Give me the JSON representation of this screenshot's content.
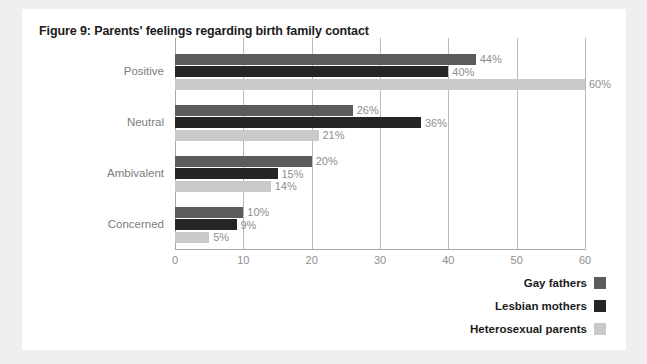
{
  "figure": {
    "title": "Figure 9: Parents' feelings regarding birth family contact"
  },
  "colors": {
    "gay_fathers": "#5b5b5b",
    "lesbian_mothers": "#252525",
    "heterosexual_parents": "#c9c9c9",
    "page_background": "#f0efee",
    "card_background": "#ffffff",
    "grid": "#b9b9b9",
    "tick_text": "#8e8e8e",
    "category_text": "#7d7d7d",
    "title_text": "#1b1b1b"
  },
  "legend": {
    "items": [
      {
        "label": "Gay fathers",
        "color": "#5b5b5b"
      },
      {
        "label": "Lesbian mothers",
        "color": "#252525"
      },
      {
        "label": "Heterosexual parents",
        "color": "#c9c9c9"
      }
    ]
  },
  "axis": {
    "ticks": [
      "0",
      "10",
      "20",
      "30",
      "40",
      "50",
      "60"
    ]
  },
  "chart_data": {
    "type": "bar",
    "orientation": "horizontal",
    "title": "Figure 9: Parents' feelings regarding birth family contact",
    "xlabel": "",
    "ylabel": "",
    "xlim": [
      0,
      60
    ],
    "xticks": [
      0,
      10,
      20,
      30,
      40,
      50,
      60
    ],
    "grid": true,
    "legend_position": "bottom-right",
    "categories": [
      "Positive",
      "Neutral",
      "Ambivalent",
      "Concerned"
    ],
    "series": [
      {
        "name": "Gay fathers",
        "color": "#5b5b5b",
        "values": [
          44,
          26,
          20,
          10
        ],
        "labels": [
          "44%",
          "26%",
          "20%",
          "10%"
        ]
      },
      {
        "name": "Lesbian mothers",
        "color": "#252525",
        "values": [
          40,
          36,
          15,
          9
        ],
        "labels": [
          "40%",
          "36%",
          "15%",
          "9%"
        ]
      },
      {
        "name": "Heterosexual parents",
        "color": "#c9c9c9",
        "values": [
          60,
          21,
          14,
          5
        ],
        "labels": [
          "60%",
          "21%",
          "14%",
          "5%"
        ]
      }
    ]
  }
}
